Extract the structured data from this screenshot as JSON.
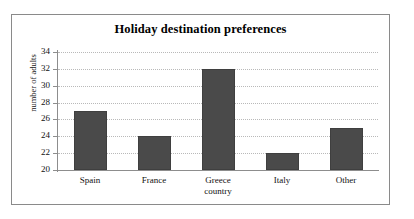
{
  "chart_data": {
    "type": "bar",
    "title": "Holiday destination preferences",
    "xlabel": "country",
    "ylabel": "number of adults",
    "categories": [
      "Spain",
      "France",
      "Greece",
      "Italy",
      "Other"
    ],
    "values": [
      27,
      24,
      32,
      22,
      25
    ],
    "ylim": [
      20,
      34
    ],
    "yticks": [
      20,
      22,
      24,
      26,
      28,
      30,
      32,
      34
    ],
    "ytick_labels": [
      "20",
      "22",
      "24",
      "26",
      "28",
      "30",
      "32",
      "34"
    ],
    "grid": "horizontal-dotted",
    "legend": "none",
    "bar_color": "#4a4a4a",
    "grid_color": "#b9b9b9",
    "axis_color": "#8d8d8d",
    "frame_color": "#8a8a8a",
    "background": "#ffffff"
  }
}
